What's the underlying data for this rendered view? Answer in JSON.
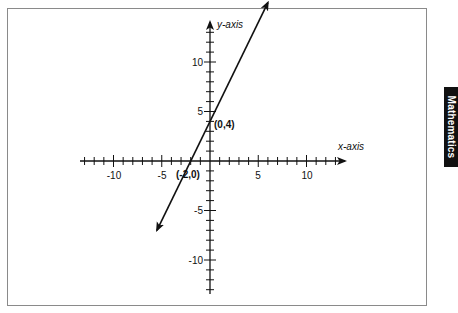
{
  "chart_data": {
    "type": "line",
    "title": "",
    "xlabel": "x-axis",
    "ylabel": "y-axis",
    "xlim": [
      -13,
      13
    ],
    "ylim": [
      -13,
      13
    ],
    "grid": false,
    "x_ticks": [
      -10,
      -5,
      5,
      10
    ],
    "y_ticks": [
      10,
      5,
      -5,
      -10
    ],
    "x_tick_labels": [
      "-10",
      "-5",
      "5",
      "10"
    ],
    "y_tick_labels": [
      "10",
      "5",
      "-5",
      "-10"
    ],
    "minor_tick_step": 1,
    "series": [
      {
        "name": "y = 2x + 4",
        "equation": "y = 2x + 4",
        "slope": 2,
        "intercept": 4,
        "x": [
          -5.5,
          6
        ],
        "y": [
          -7,
          16
        ],
        "arrows_both_ends": true
      }
    ],
    "annotations": [
      {
        "text": "(0,4)",
        "x": 0,
        "y": 4
      },
      {
        "text": "(-2,0)",
        "x": -2,
        "y": 0
      }
    ]
  },
  "labels": {
    "x_axis": "x-axis",
    "y_axis": "y-axis",
    "point_y_intercept": "(0,4)",
    "point_x_intercept": "(-2,0)",
    "x_tick_neg10": "-10",
    "x_tick_neg5": "-5",
    "x_tick_5": "5",
    "x_tick_10": "10",
    "y_tick_10": "10",
    "y_tick_5": "5",
    "y_tick_neg5": "-5",
    "y_tick_neg10": "-10"
  },
  "side_tab": {
    "label": "Mathematics"
  }
}
